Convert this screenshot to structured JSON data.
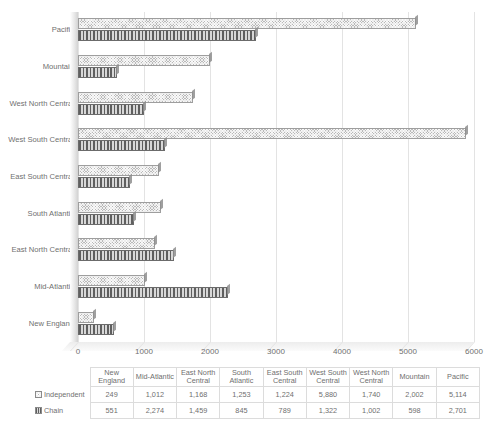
{
  "chart_data": {
    "type": "bar",
    "orientation": "horizontal",
    "title": "",
    "xlabel": "",
    "ylabel": "",
    "xlim": [
      0,
      6000
    ],
    "xticks": [
      0,
      1000,
      2000,
      3000,
      4000,
      5000,
      6000
    ],
    "xtick_labels": [
      "0",
      "1000",
      "2000",
      "3000",
      "4000",
      "5000",
      "6000"
    ],
    "grid": true,
    "legend_position": "data-table",
    "categories": [
      "New England",
      "Mid-Atlantic",
      "East North Central",
      "South Atlantic",
      "East South Central",
      "West South Central",
      "West North Central",
      "Mountain",
      "Pacific"
    ],
    "series": [
      {
        "name": "Independent",
        "pattern": "checker-hatch",
        "color": "#b9b9b9",
        "values": [
          249,
          1012,
          1168,
          1253,
          1224,
          5880,
          1740,
          2002,
          5114
        ],
        "labels": [
          "249",
          "1,012",
          "1,168",
          "1,253",
          "1,224",
          "5,880",
          "1,740",
          "2,002",
          "5,114"
        ]
      },
      {
        "name": "Chain",
        "pattern": "vertical-stripes",
        "color": "#d8d8d8",
        "values": [
          551,
          2274,
          1459,
          845,
          789,
          1322,
          1002,
          598,
          2701
        ],
        "labels": [
          "551",
          "2,274",
          "1,459",
          "845",
          "789",
          "1,322",
          "1,002",
          "598",
          "2,701"
        ]
      }
    ]
  },
  "data_table": {
    "corner_label": "",
    "column_headers": [
      "New England",
      "Mid-Atlantic",
      "East North Central",
      "South Atlantic",
      "East South Central",
      "West South Central",
      "West North Central",
      "Mountain",
      "Pacific"
    ],
    "rows": [
      {
        "label": "Independent",
        "values": [
          "249",
          "1,012",
          "1,168",
          "1,253",
          "1,224",
          "5,880",
          "1,740",
          "2,002",
          "5,114"
        ]
      },
      {
        "label": "Chain",
        "values": [
          "551",
          "2,274",
          "1,459",
          "845",
          "789",
          "1,322",
          "1,002",
          "598",
          "2,701"
        ]
      }
    ]
  },
  "colors": {
    "independent": "#b9b9b9",
    "chain": "#d8d8d8",
    "gridline": "#e3e3e3",
    "text": "#6f6f6f",
    "table_border": "#dcdcdc"
  }
}
